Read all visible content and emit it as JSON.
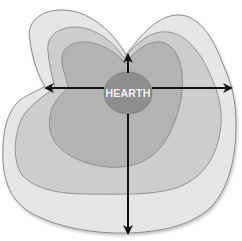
{
  "diagram": {
    "center_label": "HEARTH",
    "zones": [
      {
        "name": "outer-zone",
        "fill": "#e6e6e6",
        "stroke": "#8a8a8a"
      },
      {
        "name": "third-zone",
        "fill": "#cdcdcd",
        "stroke": "#8a8a8a"
      },
      {
        "name": "second-zone",
        "fill": "#b3b3b3",
        "stroke": "#8a8a8a"
      },
      {
        "name": "hearth-zone",
        "fill": "#8e8e8e",
        "stroke": "#7a7a7a"
      }
    ],
    "arrows": [
      "up",
      "left",
      "right",
      "down"
    ],
    "arrow_color": "#111111"
  }
}
